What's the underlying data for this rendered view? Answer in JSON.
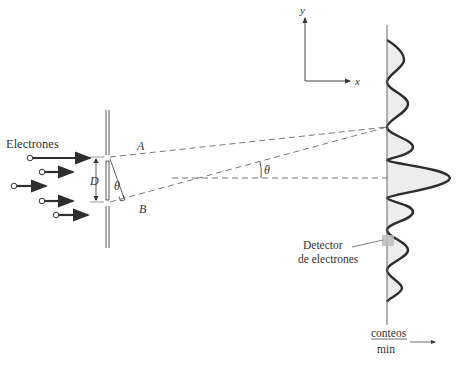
{
  "diagram": {
    "labels": {
      "source": "Electrones",
      "ray_a": "A",
      "ray_b": "B",
      "slit_separation": "D",
      "angle_at_slit": "θ",
      "angle_at_center": "θ",
      "detector": "Detector\nde electrones",
      "detector_line1": "Detector",
      "detector_line2": "de electrones",
      "counts_numerator": "conteos",
      "counts_denominator": "min",
      "axis_y": "y",
      "axis_x": "x"
    },
    "colors": {
      "line": "#3a3a3a",
      "curve": "#2e2e2e",
      "fill": "#ececec",
      "detector": "#bdbdbd",
      "dashed": "#555555"
    },
    "electron_count": 5,
    "intensity_pattern": "central maximum with decreasing side fringes"
  }
}
